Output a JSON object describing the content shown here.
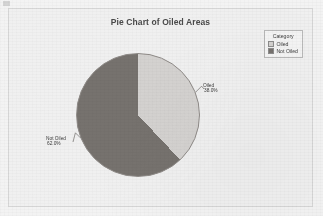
{
  "chart_data": {
    "type": "pie",
    "title": "Pie Chart of Oiled Areas",
    "categories": [
      "Oiled",
      "Not Oiled"
    ],
    "values": [
      38.0,
      62.0
    ],
    "value_labels": [
      "38.0%",
      "62.0%"
    ],
    "colors": [
      "#d4d2d0",
      "#76726e"
    ],
    "legend_title": "Category",
    "legend_position": "top-right",
    "start_angle_deg": 0,
    "direction": "clockwise",
    "grid": false,
    "xlabel": "",
    "ylabel": ""
  },
  "chart": {
    "title": "Pie Chart of Oiled Areas"
  },
  "legend": {
    "title": "Category",
    "items": [
      {
        "label": "Oiled",
        "color": "#d4d2d0"
      },
      {
        "label": "Not Oiled",
        "color": "#76726e"
      }
    ]
  },
  "labels": {
    "oiled": {
      "name": "Oiled",
      "percent": "38.0%"
    },
    "not_oiled": {
      "name": "Not Oiled",
      "percent": "62.0%"
    }
  }
}
